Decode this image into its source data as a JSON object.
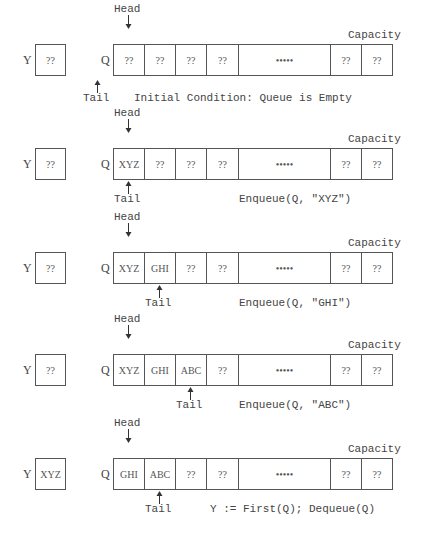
{
  "labels": {
    "y_var": "Y",
    "q_var": "Q",
    "head": "Head",
    "tail": "Tail",
    "capacity": "Capacity",
    "ellipsis": "•••••"
  },
  "panels": [
    {
      "y_value": "??",
      "cells": [
        "??",
        "??",
        "??",
        "??",
        "•••••",
        "??",
        "??"
      ],
      "head_index": 0,
      "tail_index": -1,
      "caption": "Initial Condition: Queue is Empty"
    },
    {
      "y_value": "??",
      "cells": [
        "XYZ",
        "??",
        "??",
        "??",
        "•••••",
        "??",
        "??"
      ],
      "head_index": 0,
      "tail_index": 0,
      "caption": "Enqueue(Q, \"XYZ\")"
    },
    {
      "y_value": "??",
      "cells": [
        "XYZ",
        "GHI",
        "??",
        "??",
        "•••••",
        "??",
        "??"
      ],
      "head_index": 0,
      "tail_index": 1,
      "caption": "Enqueue(Q, \"GHI\")"
    },
    {
      "y_value": "??",
      "cells": [
        "XYZ",
        "GHI",
        "ABC",
        "??",
        "•••••",
        "??",
        "??"
      ],
      "head_index": 0,
      "tail_index": 2,
      "caption": "Enqueue(Q, \"ABC\")"
    },
    {
      "y_value": "XYZ",
      "cells": [
        "GHI",
        "ABC",
        "??",
        "??",
        "•••••",
        "??",
        "??"
      ],
      "head_index": 0,
      "tail_index": 1,
      "caption": "Y := First(Q); Dequeue(Q)"
    }
  ]
}
